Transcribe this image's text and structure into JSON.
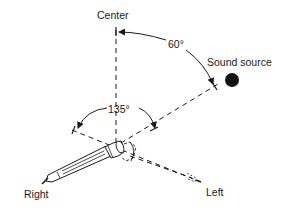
{
  "diagram": {
    "type": "microphone-angle-diagram",
    "labels": {
      "center": "Center",
      "sound_source": "Sound source",
      "angle_source": "60°",
      "angle_pickup": "135°",
      "right": "Right",
      "left": "Left"
    },
    "angles": {
      "sound_source_from_center_deg": 60,
      "microphone_spread_deg": 135
    },
    "colors": {
      "ink": "#1a1a1a",
      "background": "#ffffff"
    }
  }
}
